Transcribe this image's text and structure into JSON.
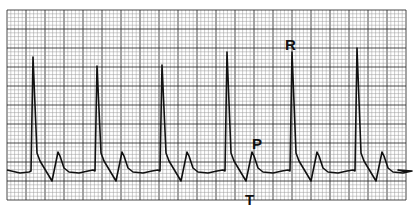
{
  "figure": {
    "type": "ECG rhythm strip",
    "labels": {
      "r": "R",
      "p": "P",
      "t": "T"
    },
    "colors": {
      "grid_minor": "#9a9a9a",
      "grid_major": "#333333",
      "trace": "#111111",
      "background": "#ffffff"
    },
    "grid": {
      "x0": 7,
      "y0": 10,
      "x1": 406,
      "y1": 200,
      "minor": 3.8,
      "major": 19
    },
    "beats_r_x": [
      33,
      97,
      162,
      227,
      292,
      357
    ],
    "r_peak_y": [
      57,
      66,
      65,
      52,
      52,
      48
    ],
    "baseline_y": 173
  }
}
